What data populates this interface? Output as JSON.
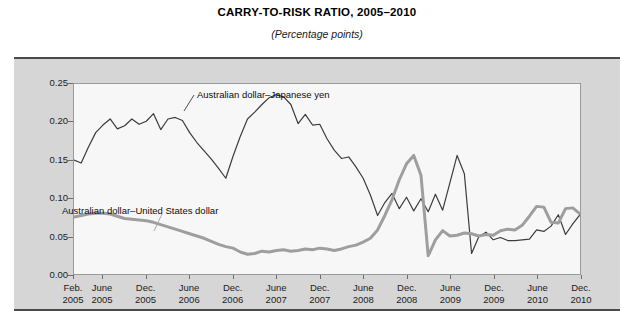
{
  "figure": {
    "title": "CARRY-TO-RISK RATIO, 2005–2010",
    "subtitle": "(Percentage points)"
  },
  "axis": {
    "y_ticks": [
      "0.25",
      "0.20",
      "0.15",
      "0.10",
      "0.05",
      "0.00"
    ],
    "x_ticks": [
      {
        "month": "Feb.",
        "year": "2005"
      },
      {
        "month": "June",
        "year": "2005"
      },
      {
        "month": "Dec.",
        "year": "2005"
      },
      {
        "month": "June",
        "year": "2006"
      },
      {
        "month": "Dec.",
        "year": "2006"
      },
      {
        "month": "June",
        "year": "2007"
      },
      {
        "month": "Dec.",
        "year": "2007"
      },
      {
        "month": "June",
        "year": "2008"
      },
      {
        "month": "Dec.",
        "year": "2008"
      },
      {
        "month": "June",
        "year": "2009"
      },
      {
        "month": "Dec.",
        "year": "2009"
      },
      {
        "month": "June",
        "year": "2010"
      },
      {
        "month": "Dec.",
        "year": "2010"
      }
    ]
  },
  "annotations": {
    "jpy_label": "Australian dollar–Japanese yen",
    "usd_label": "Australian dollar–United States dollar"
  },
  "colors": {
    "panel_background": "#d6d6d6",
    "plot_background": "#f7f7f7",
    "rule": "#4a4a4a",
    "series_jpy": "#3c3c3c",
    "series_usd": "#9e9e9e"
  },
  "chart_data": {
    "type": "line",
    "title": "CARRY-TO-RISK RATIO, 2005–2010",
    "subtitle": "(Percentage points)",
    "xlabel": "",
    "ylabel": "Percentage points",
    "ylim": [
      0.0,
      0.25
    ],
    "yticks": [
      0.0,
      0.05,
      0.1,
      0.15,
      0.2,
      0.25
    ],
    "grid": false,
    "legend_position": "inline-annotations",
    "x_start": "2005-02",
    "x_end": "2010-12",
    "x_interval": "monthly",
    "x": [
      "2005-02",
      "2005-03",
      "2005-04",
      "2005-05",
      "2005-06",
      "2005-07",
      "2005-08",
      "2005-09",
      "2005-10",
      "2005-11",
      "2005-12",
      "2006-01",
      "2006-02",
      "2006-03",
      "2006-04",
      "2006-05",
      "2006-06",
      "2006-07",
      "2006-08",
      "2006-09",
      "2006-10",
      "2006-11",
      "2006-12",
      "2007-01",
      "2007-02",
      "2007-03",
      "2007-04",
      "2007-05",
      "2007-06",
      "2007-07",
      "2007-08",
      "2007-09",
      "2007-10",
      "2007-11",
      "2007-12",
      "2008-01",
      "2008-02",
      "2008-03",
      "2008-04",
      "2008-05",
      "2008-06",
      "2008-07",
      "2008-08",
      "2008-09",
      "2008-10",
      "2008-11",
      "2008-12",
      "2009-01",
      "2009-02",
      "2009-03",
      "2009-04",
      "2009-05",
      "2009-06",
      "2009-07",
      "2009-08",
      "2009-09",
      "2009-10",
      "2009-11",
      "2009-12",
      "2010-01",
      "2010-02",
      "2010-03",
      "2010-04",
      "2010-05",
      "2010-06",
      "2010-07",
      "2010-08",
      "2010-09",
      "2010-10",
      "2010-11",
      "2010-12"
    ],
    "series": [
      {
        "name": "Australian dollar–Japanese yen",
        "color": "#3c3c3c",
        "width": 1.2,
        "values": [
          0.15,
          0.146,
          0.167,
          0.186,
          0.196,
          0.204,
          0.191,
          0.195,
          0.204,
          0.197,
          0.201,
          0.211,
          0.19,
          0.204,
          0.206,
          0.202,
          0.186,
          0.173,
          0.162,
          0.151,
          0.139,
          0.126,
          0.155,
          0.181,
          0.204,
          0.213,
          0.223,
          0.232,
          0.236,
          0.233,
          0.223,
          0.198,
          0.21,
          0.196,
          0.197,
          0.178,
          0.163,
          0.152,
          0.154,
          0.141,
          0.126,
          0.104,
          0.077,
          0.094,
          0.106,
          0.086,
          0.101,
          0.083,
          0.099,
          0.082,
          0.105,
          0.084,
          0.12,
          0.156,
          0.132,
          0.027,
          0.049,
          0.055,
          0.045,
          0.048,
          0.044,
          0.044,
          0.045,
          0.046,
          0.058,
          0.056,
          0.063,
          0.078,
          0.052,
          0.066,
          0.078
        ]
      },
      {
        "name": "Australian dollar–United States dollar",
        "color": "#9e9e9e",
        "width": 3.0,
        "values": [
          0.075,
          0.077,
          0.079,
          0.08,
          0.08,
          0.079,
          0.076,
          0.073,
          0.072,
          0.071,
          0.07,
          0.068,
          0.065,
          0.062,
          0.059,
          0.056,
          0.053,
          0.05,
          0.047,
          0.043,
          0.039,
          0.036,
          0.034,
          0.029,
          0.026,
          0.027,
          0.03,
          0.029,
          0.031,
          0.032,
          0.03,
          0.031,
          0.033,
          0.032,
          0.034,
          0.033,
          0.031,
          0.033,
          0.036,
          0.038,
          0.042,
          0.047,
          0.058,
          0.077,
          0.098,
          0.124,
          0.145,
          0.156,
          0.13,
          0.024,
          0.045,
          0.057,
          0.05,
          0.051,
          0.054,
          0.053,
          0.05,
          0.052,
          0.051,
          0.057,
          0.059,
          0.058,
          0.064,
          0.076,
          0.089,
          0.088,
          0.068,
          0.067,
          0.086,
          0.087,
          0.079
        ]
      }
    ]
  }
}
